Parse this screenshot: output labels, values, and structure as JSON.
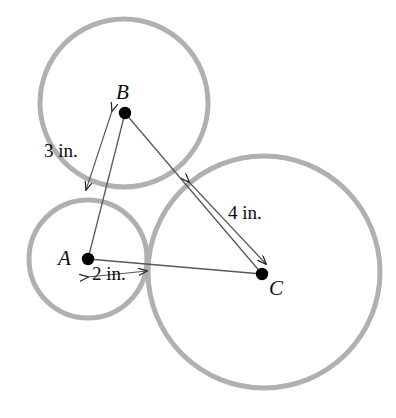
{
  "figure": {
    "units": "in.",
    "background_color": "#ffffff",
    "circle_stroke_color": "#b0b0b0",
    "circle_stroke_width": 5,
    "line_color": "#4a4a4a",
    "point_color": "#000000",
    "text_color": "#0d0d0d"
  },
  "circles": [
    {
      "id": "circle-A",
      "center_label": "A",
      "cx": 88,
      "cy": 259,
      "r": 59,
      "radius_in": 2
    },
    {
      "id": "circle-B",
      "center_label": "B",
      "cx": 124,
      "cy": 103,
      "r": 84,
      "radius_in": 3
    },
    {
      "id": "circle-C",
      "center_label": "C",
      "cx": 264,
      "cy": 272,
      "r": 116,
      "radius_in": 4
    }
  ],
  "points": [
    {
      "id": "point-A",
      "label": "A",
      "x": 88,
      "y": 259,
      "label_x": 58,
      "label_y": 248
    },
    {
      "id": "point-B",
      "label": "B",
      "x": 125,
      "y": 113,
      "label_x": 116,
      "label_y": 82
    },
    {
      "id": "point-C",
      "label": "C",
      "x": 262,
      "y": 274,
      "label_x": 269,
      "label_y": 278
    }
  ],
  "triangle": {
    "vertices": [
      "A",
      "B",
      "C"
    ],
    "edges": [
      {
        "from": "A",
        "to": "B"
      },
      {
        "from": "B",
        "to": "C"
      },
      {
        "from": "A",
        "to": "C"
      }
    ]
  },
  "dimensions": [
    {
      "id": "dim-3in",
      "label": "3 in.",
      "value": 3,
      "unit": "in.",
      "measures": "radius of circle B",
      "from_x": 112,
      "from_y": 111,
      "to_x": 86,
      "to_y": 190,
      "label_x": 44,
      "label_y": 141
    },
    {
      "id": "dim-2in",
      "label": "2 in.",
      "value": 2,
      "unit": "in.",
      "measures": "radius of circle A",
      "from_x": 88,
      "from_y": 277,
      "to_x": 147,
      "to_y": 271,
      "label_x": 92,
      "label_y": 264
    },
    {
      "id": "dim-4in",
      "label": "4 in.",
      "value": 4,
      "unit": "in.",
      "measures": "radius of circle C",
      "from_x": 189,
      "from_y": 182,
      "to_x": 266,
      "to_y": 264,
      "label_x": 228,
      "label_y": 203
    }
  ]
}
